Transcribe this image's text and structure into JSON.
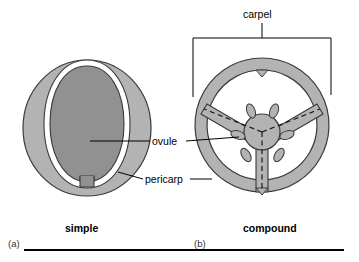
{
  "figure": {
    "title_implied": "Simple versus compound carpel cross-sections",
    "type": "botanical-cross-section-diagram",
    "background_color": "#ffffff"
  },
  "labels": {
    "carpel": "carpel",
    "ovule": "ovule",
    "pericarp": "pericarp",
    "simple": "simple",
    "compound": "compound",
    "panel_a": "(a)",
    "panel_b": "(b)"
  },
  "colors": {
    "pericarp_fill": "#b3b3b3",
    "ovule_fill": "#919191",
    "outline": "#3a3a3a",
    "locule_fill": "#ffffff",
    "leader_line": "#000000",
    "bracket_line": "#000000",
    "rule_line": "#000000",
    "text": "#000000"
  },
  "panels": [
    {
      "id": "a",
      "caption": "simple",
      "panel_label": "(a)",
      "description": "Simple carpel: single locule with one ovule enclosed by pericarp",
      "parts": [
        "pericarp",
        "locule",
        "ovule",
        "funiculus"
      ],
      "ovule_count": 1,
      "locule_count": 1,
      "carpel_count": 1
    },
    {
      "id": "b",
      "caption": "compound",
      "panel_label": "(b)",
      "description": "Compound carpel: three fused carpels forming three locules with ovules on a central placenta",
      "parts": [
        "pericarp",
        "septum",
        "central placenta",
        "ovule"
      ],
      "ovule_count": 6,
      "locule_count": 3,
      "carpel_count": 3,
      "septa_count": 3,
      "fusion_lines": "dashed lines mark boundaries between fused carpels"
    }
  ],
  "annotations": [
    {
      "name": "carpel",
      "text": "carpel",
      "target_panel": "b",
      "connector": "bracket-with-stem"
    },
    {
      "name": "ovule",
      "text": "ovule",
      "target_panel": "both",
      "connector": "leader-line-both-sides"
    },
    {
      "name": "pericarp",
      "text": "pericarp",
      "target_panel": "both",
      "connector": "leader-line-both-sides"
    }
  ]
}
